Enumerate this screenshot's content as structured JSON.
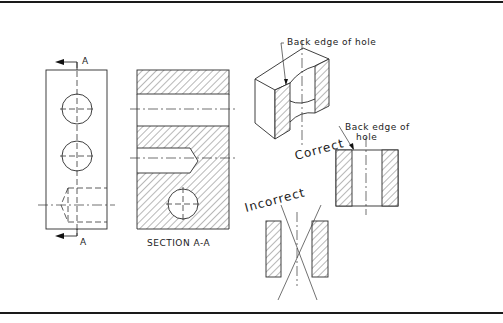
{
  "figure": {
    "views": {
      "front_view": {
        "cutting_plane_label_top": "A",
        "cutting_plane_label_bottom": "A"
      },
      "section_view": {
        "caption": "SECTION A-A"
      },
      "isometric_view": {
        "leader_label": "Back edge of hole"
      },
      "correct_view": {
        "title": "Correct",
        "leader_label_line1": "Back edge of",
        "leader_label_line2": "hole"
      },
      "incorrect_view": {
        "title": "Incorrect"
      }
    },
    "colors": {
      "line": "#2a2a2a",
      "background": "#ffffff",
      "border": "#1a1a1a"
    }
  }
}
